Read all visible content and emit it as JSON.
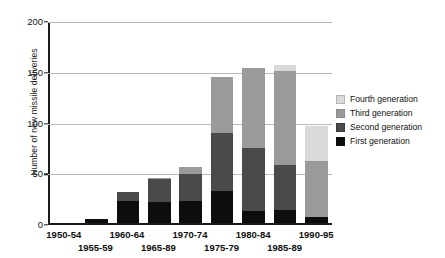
{
  "chart_data": {
    "type": "bar",
    "stacked": true,
    "title": "",
    "xlabel": "",
    "ylabel": "Number of new missile deliveries",
    "ylim": [
      0,
      200
    ],
    "yticks": [
      0,
      50,
      100,
      150,
      200
    ],
    "grid": "horizontal",
    "legend_position": "right",
    "categories": [
      "1950-54",
      "1955-59",
      "1960-64",
      "1965-89",
      "1970-74",
      "1975-79",
      "1980-84",
      "1985-89",
      "1990-95"
    ],
    "series": [
      {
        "name": "First generation",
        "color": "#0d0d0d",
        "values": [
          0,
          4,
          22,
          21,
          22,
          32,
          12,
          13,
          6
        ]
      },
      {
        "name": "Second generation",
        "color": "#4a4a4a",
        "values": [
          0,
          0,
          9,
          23,
          27,
          57,
          62,
          45,
          0
        ]
      },
      {
        "name": "Third generation",
        "color": "#9a9a9a",
        "values": [
          0,
          0,
          0,
          1,
          7,
          55,
          79,
          92,
          56
        ]
      },
      {
        "name": "Fourth generation",
        "color": "#d9d9d9",
        "values": [
          0,
          0,
          0,
          0,
          0,
          0,
          0,
          6,
          34
        ]
      }
    ],
    "totals": [
      0,
      4,
      31,
      45,
      56,
      144,
      153,
      156,
      96
    ]
  },
  "axes": {
    "y_tick_labels": [
      "200",
      "150",
      "100",
      "50",
      "0"
    ],
    "y_title": "Number of new missile deliveries",
    "x_tick_labels_top_row": [
      "1950-54",
      "1960-64",
      "1970-74",
      "1980-84",
      "1990-95"
    ],
    "x_tick_labels_bottom_row": [
      "1955-59",
      "1965-89",
      "1975-79",
      "1985-89"
    ]
  },
  "legend": {
    "entries": [
      {
        "label": "Fourth generation",
        "color": "#d9d9d9",
        "key": "g4"
      },
      {
        "label": "Third generation",
        "color": "#9a9a9a",
        "key": "g3"
      },
      {
        "label": "Second generation",
        "color": "#4a4a4a",
        "key": "g2"
      },
      {
        "label": "First generation",
        "color": "#0d0d0d",
        "key": "g1"
      }
    ]
  }
}
